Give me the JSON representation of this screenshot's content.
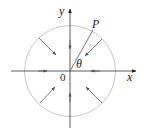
{
  "diagram": {
    "labels": {
      "x_axis": "x",
      "y_axis": "y",
      "origin": "0",
      "point": "P",
      "angle": "θ"
    },
    "colors": {
      "axis": "#333333",
      "circle": "#c8c8c8",
      "arrow": "#555555",
      "radius_line": "#555555"
    }
  }
}
